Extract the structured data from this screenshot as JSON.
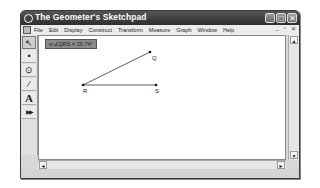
{
  "window": {
    "title": "The Geometer's Sketchpad",
    "controls": {
      "minimize": "_",
      "maximize": "□",
      "close": "✕"
    }
  },
  "menubar": {
    "items": [
      "File",
      "Edit",
      "Display",
      "Construct",
      "Transform",
      "Measure",
      "Graph",
      "Window",
      "Help"
    ],
    "doc_controls": {
      "minimize": "_",
      "restore": "▫",
      "close": "✕"
    }
  },
  "toolbox": {
    "tools": [
      {
        "name": "selection-arrow",
        "glyph": "↖"
      },
      {
        "name": "point",
        "glyph": "•"
      },
      {
        "name": "compass",
        "glyph": "⊙"
      },
      {
        "name": "straightedge",
        "glyph": "⁄"
      },
      {
        "name": "text",
        "glyph": "A"
      },
      {
        "name": "custom",
        "glyph": "▶▶"
      }
    ]
  },
  "sketch": {
    "measurement": "m∠QRS = 26.74°",
    "points": [
      {
        "label": "Q",
        "x": 111,
        "y": 16
      },
      {
        "label": "R",
        "x": 44,
        "y": 49
      },
      {
        "label": "S",
        "x": 117,
        "y": 49
      }
    ],
    "segments": [
      [
        "R",
        "Q"
      ],
      [
        "R",
        "S"
      ]
    ]
  },
  "scrollbars": {
    "up": "▲",
    "down": "▼",
    "left": "◄",
    "right": "►"
  }
}
